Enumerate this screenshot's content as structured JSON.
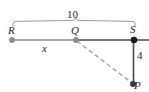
{
  "figure": {
    "labels": {
      "measure_top": "10",
      "point_r": "R",
      "point_q": "Q",
      "point_s": "S",
      "segment_x": "x",
      "measure_side": "4",
      "point_p": "P"
    },
    "colors": {
      "line_gray": "#8d8d8d",
      "line_dark": "#262626",
      "dot_gray": "#8d8d8d",
      "dot_dark": "#1a1a1a",
      "dashed": "#a8a8a8",
      "brace": "#8d8d8d",
      "text": "#262626",
      "background": "#ffffff"
    },
    "geometry": {
      "points": [
        {
          "name": "R",
          "x": 12,
          "y": 40,
          "style": "gray-dot"
        },
        {
          "name": "Q",
          "x": 76,
          "y": 40,
          "style": "gray-dot"
        },
        {
          "name": "S",
          "x": 134,
          "y": 40,
          "style": "dark-dot"
        },
        {
          "name": "P",
          "x": 133,
          "y": 84,
          "style": "dark-dot"
        }
      ],
      "segments": [
        {
          "name": "R-to-Q",
          "from": "R",
          "to": "Q",
          "style": "solid-gray",
          "label": "x"
        },
        {
          "name": "Q-to-S-extended",
          "from": "Q",
          "to": "right-edge",
          "style": "solid-dark"
        },
        {
          "name": "S-to-P",
          "from": "S",
          "to": "P",
          "style": "solid-dark",
          "label": "4"
        },
        {
          "name": "Q-to-P",
          "from": "Q",
          "to": "P",
          "style": "dashed-gray"
        }
      ],
      "brace": {
        "name": "R-to-S-brace",
        "from_x": 13,
        "to_x": 135,
        "y": 22,
        "label": "10"
      }
    }
  }
}
